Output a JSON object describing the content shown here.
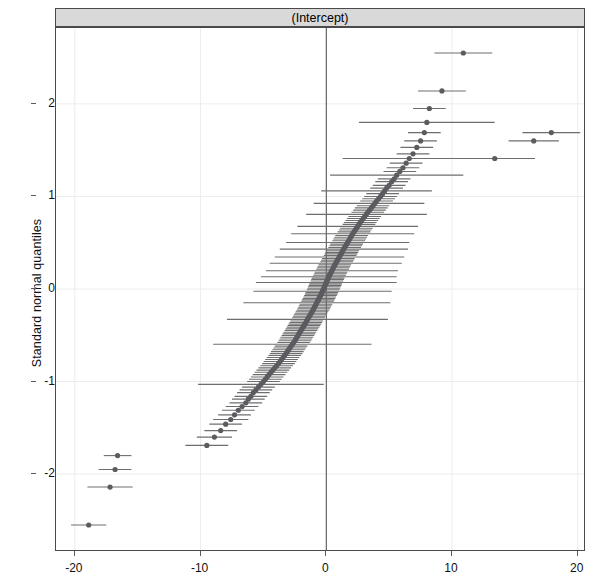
{
  "panel": {
    "strip_title": "(Intercept)"
  },
  "axes": {
    "y_title": "Standard normal quantiles",
    "x_ticks": [
      "-20",
      "-10",
      "0",
      "10",
      "20"
    ],
    "x_tick_values": [
      -20,
      -10,
      0,
      10,
      20
    ],
    "y_ticks": [
      "-2",
      "-1",
      "0",
      "1",
      "2"
    ],
    "y_tick_values": [
      -2,
      -1,
      0,
      1,
      2
    ]
  },
  "style": {
    "strip_fill": "#d9d9d9",
    "frame_color": "#4a4a4a",
    "point_color": "#5b5b60",
    "errorbar_color": "#6e6e6e",
    "grid_color": "#ececed",
    "background": "#ffffff"
  },
  "chart_data": {
    "type": "scatter",
    "title": "(Intercept)",
    "subtitle": "",
    "xlabel": "",
    "ylabel": "Standard normal quantiles",
    "xlim": [
      -21.5,
      20.5
    ],
    "ylim": [
      -2.82,
      2.82
    ],
    "grid": true,
    "legend": null,
    "reference_lines": [
      {
        "orientation": "vertical",
        "x": 0
      }
    ],
    "marker": "filled-circle",
    "errorbar_orientation": "horizontal",
    "x": [
      -18.9,
      -17.2,
      -16.8,
      -16.6,
      -9.5,
      -8.9,
      -8.4,
      -8.0,
      -7.6,
      -7.3,
      -7.0,
      -6.7,
      -6.4,
      -6.2,
      -6.0,
      -5.8,
      -5.6,
      -5.4,
      -5.2,
      -5.0,
      -4.85,
      -4.7,
      -4.55,
      -4.4,
      -4.25,
      -4.1,
      -3.95,
      -3.8,
      -3.68,
      -3.56,
      -3.44,
      -3.32,
      -3.2,
      -3.1,
      -3.0,
      -2.9,
      -2.8,
      -2.7,
      -2.6,
      -2.5,
      -2.42,
      -2.34,
      -2.26,
      -2.18,
      -2.1,
      -2.02,
      -1.94,
      -1.86,
      -1.78,
      -1.7,
      -1.63,
      -1.56,
      -1.49,
      -1.42,
      -1.35,
      -1.28,
      -1.21,
      -1.14,
      -1.07,
      -1.0,
      -0.94,
      -0.88,
      -0.82,
      -0.76,
      -0.7,
      -0.64,
      -0.58,
      -0.52,
      -0.46,
      -0.4,
      -0.35,
      -0.3,
      -0.25,
      -0.2,
      -0.15,
      -0.1,
      -0.05,
      0.0,
      0.05,
      0.1,
      0.15,
      0.2,
      0.26,
      0.32,
      0.38,
      0.44,
      0.5,
      0.56,
      0.62,
      0.68,
      0.75,
      0.82,
      0.89,
      0.96,
      1.03,
      1.1,
      1.17,
      1.24,
      1.31,
      1.38,
      1.46,
      1.54,
      1.62,
      1.7,
      1.78,
      1.86,
      1.94,
      2.02,
      2.1,
      2.2,
      2.3,
      2.4,
      2.5,
      2.6,
      2.7,
      2.82,
      2.94,
      3.06,
      3.18,
      3.3,
      3.44,
      3.58,
      3.72,
      3.86,
      4.0,
      4.16,
      4.32,
      4.48,
      4.64,
      4.8,
      5.0,
      5.2,
      5.4,
      5.6,
      5.85,
      6.1,
      6.35,
      6.6,
      6.9,
      7.2,
      7.5,
      7.8,
      8.0,
      8.2,
      9.2,
      10.9,
      13.4,
      16.5,
      17.9
    ],
    "y": [
      -2.55,
      -2.14,
      -1.95,
      -1.8,
      -1.69,
      -1.6,
      -1.53,
      -1.46,
      -1.41,
      -1.36,
      -1.31,
      -1.27,
      -1.23,
      -1.19,
      -1.16,
      -1.12,
      -1.09,
      -1.06,
      -1.03,
      -1.0,
      -0.975,
      -0.95,
      -0.925,
      -0.9,
      -0.876,
      -0.852,
      -0.829,
      -0.806,
      -0.784,
      -0.762,
      -0.74,
      -0.719,
      -0.698,
      -0.677,
      -0.657,
      -0.637,
      -0.617,
      -0.597,
      -0.578,
      -0.559,
      -0.54,
      -0.521,
      -0.503,
      -0.485,
      -0.467,
      -0.449,
      -0.431,
      -0.414,
      -0.396,
      -0.379,
      -0.362,
      -0.345,
      -0.328,
      -0.311,
      -0.295,
      -0.278,
      -0.262,
      -0.246,
      -0.229,
      -0.213,
      -0.197,
      -0.181,
      -0.165,
      -0.149,
      -0.133,
      -0.118,
      -0.102,
      -0.086,
      -0.071,
      -0.055,
      -0.039,
      -0.024,
      -0.008,
      0.008,
      0.024,
      0.039,
      0.055,
      0.071,
      0.086,
      0.102,
      0.118,
      0.133,
      0.149,
      0.165,
      0.181,
      0.197,
      0.213,
      0.229,
      0.246,
      0.262,
      0.278,
      0.295,
      0.311,
      0.328,
      0.345,
      0.362,
      0.379,
      0.396,
      0.414,
      0.431,
      0.449,
      0.467,
      0.485,
      0.503,
      0.521,
      0.54,
      0.559,
      0.578,
      0.597,
      0.617,
      0.637,
      0.657,
      0.677,
      0.698,
      0.719,
      0.74,
      0.762,
      0.784,
      0.806,
      0.829,
      0.852,
      0.876,
      0.9,
      0.925,
      0.95,
      0.975,
      1.0,
      1.03,
      1.06,
      1.09,
      1.12,
      1.16,
      1.19,
      1.23,
      1.27,
      1.31,
      1.36,
      1.41,
      1.46,
      1.53,
      1.6,
      1.69,
      1.8,
      1.95,
      2.14,
      2.55,
      1.41,
      1.6,
      1.69
    ],
    "xmin": [
      -20.3,
      -19.0,
      -18.1,
      -17.7,
      -11.2,
      -10.3,
      -9.7,
      -9.3,
      -9.0,
      -8.6,
      -8.3,
      -8.0,
      -7.7,
      -7.5,
      -7.3,
      -7.1,
      -6.9,
      -6.7,
      -10.2,
      -6.3,
      -6.15,
      -6.0,
      -5.85,
      -5.7,
      -5.55,
      -5.4,
      -5.25,
      -5.1,
      -4.98,
      -4.86,
      -4.74,
      -4.62,
      -4.5,
      -4.4,
      -4.3,
      -4.2,
      -4.1,
      -9.0,
      -3.9,
      -3.8,
      -3.72,
      -3.64,
      -3.56,
      -3.48,
      -3.4,
      -3.32,
      -3.24,
      -3.16,
      -3.08,
      -3.0,
      -2.93,
      -2.86,
      -7.9,
      -2.72,
      -2.65,
      -2.58,
      -2.51,
      -2.44,
      -2.37,
      -2.3,
      -2.24,
      -2.18,
      -2.12,
      -6.6,
      -2.0,
      -1.94,
      -1.88,
      -1.82,
      -1.76,
      -1.7,
      -1.65,
      -5.8,
      -1.55,
      -1.5,
      -1.45,
      -1.4,
      -1.35,
      -5.6,
      -1.25,
      -1.2,
      -1.15,
      -5.2,
      -1.04,
      -0.98,
      -0.92,
      -4.8,
      -0.8,
      -0.74,
      -0.68,
      -0.62,
      -4.5,
      -0.48,
      -0.41,
      -0.34,
      -4.1,
      -0.2,
      -0.13,
      -0.06,
      0.01,
      -3.7,
      0.16,
      0.24,
      0.32,
      -3.2,
      0.48,
      0.56,
      0.64,
      0.72,
      -2.8,
      0.9,
      1.0,
      1.1,
      -2.3,
      1.3,
      1.4,
      1.52,
      1.64,
      1.76,
      -1.6,
      2.0,
      2.14,
      2.28,
      2.42,
      -1.0,
      2.7,
      2.86,
      3.02,
      3.18,
      -0.4,
      3.5,
      3.7,
      3.9,
      4.1,
      0.3,
      4.55,
      4.8,
      5.05,
      1.3,
      5.6,
      5.9,
      6.2,
      6.5,
      2.6,
      6.9,
      7.3,
      8.6,
      10.2,
      14.5,
      15.6
    ],
    "xmax": [
      -17.5,
      -15.4,
      -15.5,
      -15.5,
      -7.8,
      -7.5,
      -7.1,
      -6.7,
      -6.2,
      -6.0,
      -5.7,
      -5.4,
      -5.1,
      -4.9,
      -4.7,
      -4.5,
      -4.3,
      -4.1,
      -0.2,
      -3.7,
      -3.55,
      -3.4,
      -3.25,
      -3.1,
      -2.95,
      -2.8,
      -2.65,
      -2.5,
      -2.38,
      -2.26,
      -2.14,
      -2.02,
      -1.9,
      -1.8,
      -1.7,
      -1.6,
      -1.5,
      3.6,
      -1.3,
      -1.2,
      -1.12,
      -1.04,
      -0.96,
      -0.88,
      -0.8,
      -0.72,
      -0.64,
      -0.56,
      -0.48,
      -0.4,
      -0.33,
      -0.26,
      4.9,
      -0.12,
      -0.05,
      0.02,
      0.09,
      0.16,
      0.23,
      0.3,
      0.36,
      0.42,
      0.48,
      5.1,
      0.6,
      0.66,
      0.72,
      0.78,
      0.84,
      0.9,
      0.95,
      5.2,
      1.05,
      1.1,
      1.15,
      1.2,
      1.25,
      5.6,
      1.35,
      1.4,
      1.45,
      5.6,
      1.56,
      1.62,
      1.68,
      5.7,
      1.8,
      1.86,
      1.92,
      1.98,
      6.0,
      2.12,
      2.19,
      2.26,
      6.2,
      2.4,
      2.47,
      2.54,
      2.61,
      6.5,
      2.76,
      2.84,
      2.92,
      6.6,
      3.08,
      3.16,
      3.24,
      3.32,
      7.0,
      3.5,
      3.6,
      3.7,
      7.3,
      3.9,
      4.0,
      4.12,
      4.24,
      4.36,
      8.0,
      4.6,
      4.74,
      4.88,
      5.02,
      7.8,
      5.3,
      5.46,
      5.62,
      5.78,
      8.4,
      6.1,
      6.3,
      6.5,
      6.7,
      10.9,
      7.15,
      7.4,
      7.65,
      11.9,
      8.2,
      8.5,
      8.8,
      9.1,
      13.4,
      9.5,
      11.1,
      13.2,
      16.6,
      18.5,
      20.2
    ]
  }
}
